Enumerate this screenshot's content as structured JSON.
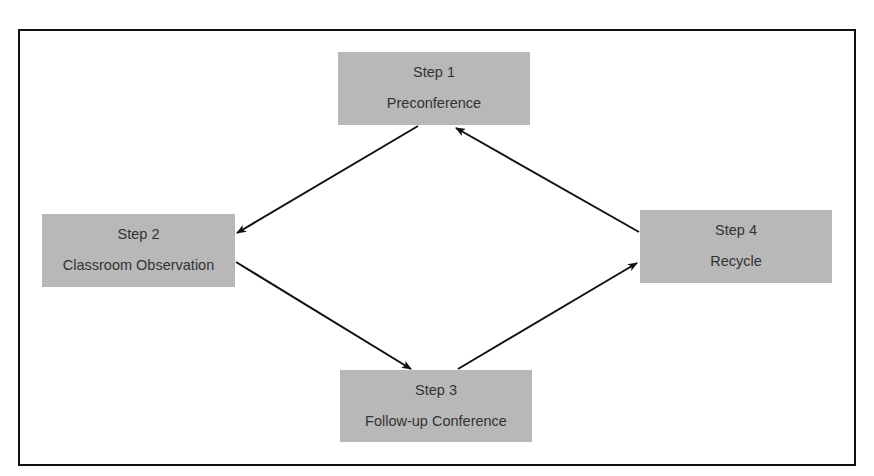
{
  "diagram": {
    "type": "cycle",
    "steps": [
      {
        "label": "Step 1",
        "name": "Preconference"
      },
      {
        "label": "Step 2",
        "name": "Classroom Observation"
      },
      {
        "label": "Step 3",
        "name": "Follow-up Conference"
      },
      {
        "label": "Step 4",
        "name": "Recycle"
      }
    ],
    "edges": [
      {
        "from": "Step 1",
        "to": "Step 2"
      },
      {
        "from": "Step 2",
        "to": "Step 3"
      },
      {
        "from": "Step 3",
        "to": "Step 4"
      },
      {
        "from": "Step 4",
        "to": "Step 1"
      }
    ],
    "colors": {
      "box_fill": "#b8b8b8",
      "text": "#333333",
      "line": "#111111",
      "background": "#ffffff"
    }
  }
}
